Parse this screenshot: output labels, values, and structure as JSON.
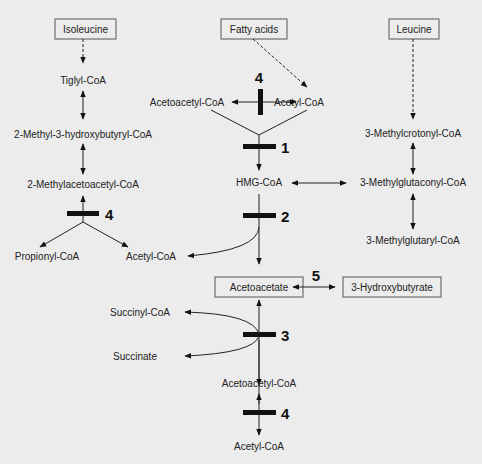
{
  "diagram": {
    "sources": {
      "isoleucine": "Isoleucine",
      "fatty_acids": "Fatty acids",
      "leucine": "Leucine"
    },
    "isoleucine_branch": {
      "tiglyl": "Tiglyl-CoA",
      "hydroxybutyryl": "2-Methyl-3-hydroxybutyryl-CoA",
      "methylacetoacetyl": "2-Methylacetoacetyl-CoA",
      "propionyl": "Propionyl-CoA",
      "acetyl": "Acetyl-CoA"
    },
    "center": {
      "acetoacetyl_top": "Acetoacetyl-CoA",
      "acetyl_top": "Acetyl-CoA",
      "hmg": "HMG-CoA",
      "acetyl_mid": "Acetyl-CoA",
      "acetoacetate": "Acetoacetate",
      "hydroxybutyrate": "3-Hydroxybutyrate",
      "succinyl": "Succinyl-CoA",
      "succinate": "Succinate",
      "acetoacetyl_bottom": "Acetoacetyl-CoA",
      "acetyl_bottom": "Acetyl-CoA"
    },
    "leucine_branch": {
      "methylcrotonyl": "3-Methylcrotonyl-CoA",
      "methylglutaconyl": "3-Methylglutaconyl-CoA",
      "methylglutaryl": "3-Methylglutaryl-CoA"
    },
    "enzyme_steps": {
      "step4_top": "4",
      "step1": "1",
      "step2": "2",
      "step4_left": "4",
      "step5": "5",
      "step3": "3",
      "step4_bottom": "4"
    }
  }
}
